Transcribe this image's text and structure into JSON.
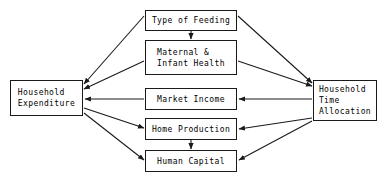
{
  "diagram": {
    "type": "flow-diagram",
    "background_color": "#ffffff",
    "line_color": "#1a1a1a",
    "text_color": "#000000",
    "nodes": [
      {
        "id": "type_of_feeding",
        "label": "Type of Feeding",
        "x": 145,
        "y": 10,
        "w": 92,
        "h": 21
      },
      {
        "id": "maternal_health",
        "label": "Maternal &\nInfant Health",
        "x": 145,
        "y": 40,
        "w": 92,
        "h": 35
      },
      {
        "id": "market_income",
        "label": "Market Income",
        "x": 145,
        "y": 88,
        "w": 92,
        "h": 22
      },
      {
        "id": "home_production",
        "label": "Home Production",
        "x": 145,
        "y": 118,
        "w": 92,
        "h": 22
      },
      {
        "id": "human_capital",
        "label": "Human Capital",
        "x": 145,
        "y": 150,
        "w": 92,
        "h": 22
      },
      {
        "id": "household_expenditure",
        "label": "Household\nExpenditure",
        "x": 10,
        "y": 80,
        "w": 73,
        "h": 36
      },
      {
        "id": "household_time_allocation",
        "label": "Household\nTime\nAllocation",
        "x": 313,
        "y": 80,
        "w": 64,
        "h": 41
      }
    ],
    "edges": [
      {
        "id": "feeding-to-maternal",
        "from": "type_of_feeding",
        "to": "maternal_health",
        "arrow": "to"
      },
      {
        "id": "feeding-to-expenditure",
        "from": "type_of_feeding",
        "to": "household_expenditure",
        "arrow": "to"
      },
      {
        "id": "feeding-to-time",
        "from": "type_of_feeding",
        "to": "household_time_allocation",
        "arrow": "to"
      },
      {
        "id": "maternal-to-expenditure",
        "from": "maternal_health",
        "to": "household_expenditure",
        "arrow": "to"
      },
      {
        "id": "maternal-to-time",
        "from": "maternal_health",
        "to": "household_time_allocation",
        "arrow": "to"
      },
      {
        "id": "income-to-expenditure",
        "from": "market_income",
        "to": "household_expenditure",
        "arrow": "to"
      },
      {
        "id": "time-to-income",
        "from": "household_time_allocation",
        "to": "market_income",
        "arrow": "to"
      },
      {
        "id": "expenditure-to-home",
        "from": "household_expenditure",
        "to": "home_production",
        "arrow": "to"
      },
      {
        "id": "time-to-home",
        "from": "household_time_allocation",
        "to": "home_production",
        "arrow": "to"
      },
      {
        "id": "home-to-human",
        "from": "home_production",
        "to": "human_capital",
        "arrow": "to"
      },
      {
        "id": "expenditure-to-human",
        "from": "household_expenditure",
        "to": "human_capital",
        "arrow": "to"
      },
      {
        "id": "time-to-human",
        "from": "household_time_allocation",
        "to": "human_capital",
        "arrow": "to"
      }
    ]
  }
}
